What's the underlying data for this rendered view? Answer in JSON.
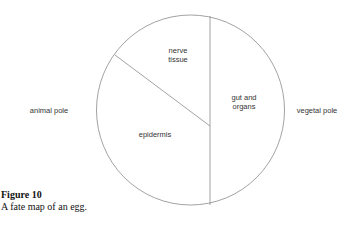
{
  "figure": {
    "title": "Figure 10",
    "caption": "A fate map of an egg."
  },
  "diagram": {
    "type": "fate-map",
    "regions": [
      {
        "id": "nerve-tissue",
        "line1": "nerve",
        "line2": "tissue"
      },
      {
        "id": "gut-and-organs",
        "line1": "gut and",
        "line2": "organs"
      },
      {
        "id": "epidermis",
        "line1": "epidermis"
      }
    ],
    "poles": {
      "left": "animal pole",
      "right": "vegetal pole"
    },
    "colors": {
      "outline": "#8a8a8a",
      "background": "#ffffff"
    }
  }
}
